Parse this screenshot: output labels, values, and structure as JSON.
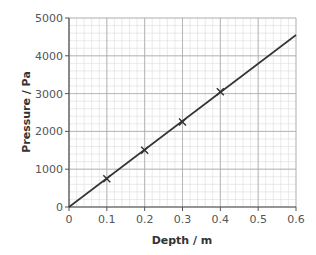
{
  "chart_data": {
    "type": "line",
    "title": "",
    "xlabel": "Depth / m",
    "ylabel": "Pressure / Pa",
    "xlim": [
      0,
      0.6
    ],
    "ylim": [
      0,
      5000
    ],
    "x_ticks": [
      "0",
      "0.1",
      "0.2",
      "0.3",
      "0.4",
      "0.5",
      "0.6"
    ],
    "y_ticks": [
      "0",
      "1000",
      "2000",
      "3000",
      "4000",
      "5000"
    ],
    "grid": true,
    "grid_minor": {
      "x_step": 0.02,
      "y_step": 200
    },
    "points": {
      "name": "measured",
      "marker": "x",
      "x": [
        0.1,
        0.2,
        0.3,
        0.4
      ],
      "y": [
        750,
        1500,
        2250,
        3050
      ]
    },
    "line": {
      "name": "best fit",
      "x": [
        0,
        0.6
      ],
      "y": [
        0,
        4550
      ]
    },
    "colors": {
      "line": "#333333",
      "grid_major": "#a8a8a8",
      "grid_minor": "#dcdcdc",
      "axis": "#555555"
    }
  }
}
